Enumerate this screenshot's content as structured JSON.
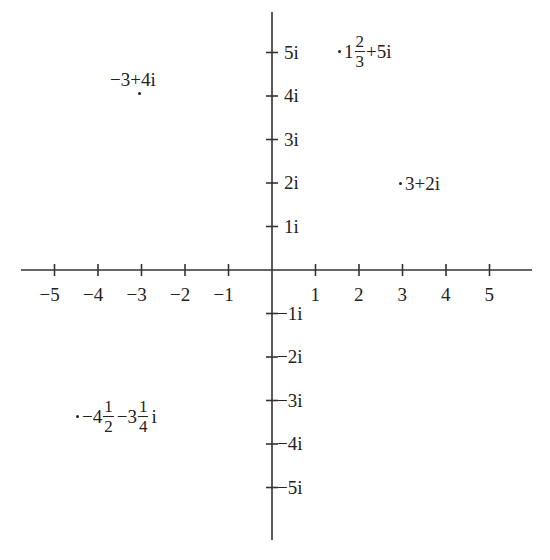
{
  "figure": {
    "type": "complex-plane",
    "axes": {
      "real_ticks": [
        "-5",
        "-4",
        "-3",
        "-2",
        "-1",
        "1",
        "2",
        "3",
        "4",
        "5"
      ],
      "imag_ticks_pos": [
        "5i",
        "4i",
        "3i",
        "2i",
        "1i"
      ],
      "imag_ticks_neg": [
        "-1i",
        "-2i",
        "-3i",
        "-4i",
        "-5i"
      ],
      "minus": "−"
    },
    "points": [
      {
        "re": -3,
        "im": 4,
        "label": "−3+4i"
      },
      {
        "re_whole": "1",
        "re_num": "2",
        "re_den": "3",
        "label_suffix": "+5i",
        "re": 1.6667,
        "im": 5
      },
      {
        "re": 3,
        "im": 2,
        "label": "3+2i"
      },
      {
        "re_whole": "−4",
        "re_num": "1",
        "re_den": "2",
        "im_whole": "−3",
        "im_num": "1",
        "im_den": "4",
        "im_suffix": "i",
        "re": -4.5,
        "im": -3.25
      }
    ]
  },
  "chart_data": {
    "type": "scatter",
    "title": "",
    "xlabel": "Real axis",
    "ylabel": "Imaginary axis",
    "xlim": [
      -5.5,
      5.5
    ],
    "ylim": [
      -5.5,
      5.5
    ],
    "x_ticks": [
      -5,
      -4,
      -3,
      -2,
      -1,
      1,
      2,
      3,
      4,
      5
    ],
    "y_ticks": [
      "-5i",
      "-4i",
      "-3i",
      "-2i",
      "-1i",
      "1i",
      "2i",
      "3i",
      "4i",
      "5i"
    ],
    "grid": false,
    "series": [
      {
        "name": "complex numbers",
        "points": [
          {
            "x": -3,
            "y": 4,
            "label": "-3+4i"
          },
          {
            "x": 1.6667,
            "y": 5,
            "label": "1 2/3+5i"
          },
          {
            "x": 3,
            "y": 2,
            "label": "3+2i"
          },
          {
            "x": -4.5,
            "y": -3.25,
            "label": "-4 1/2-3 1/4 i"
          }
        ]
      }
    ]
  }
}
